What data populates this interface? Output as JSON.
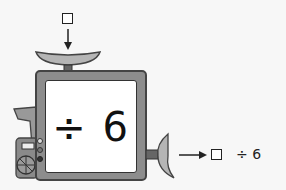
{
  "input": {
    "label": "□",
    "arrow": "down-arrow"
  },
  "machine": {
    "operation": "÷ 6",
    "operator": "÷",
    "operand": "6"
  },
  "output": {
    "box": "□",
    "expression": "÷ 6",
    "arrow": "right-arrow"
  },
  "colors": {
    "frame": "#8d8d8d",
    "outline": "#444444",
    "screen": "#ffffff",
    "background": "#f7f7f7"
  }
}
